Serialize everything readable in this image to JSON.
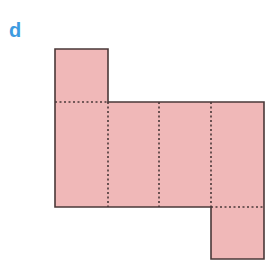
{
  "figure": {
    "label": "d",
    "colors": {
      "fill": "#f0b8b8",
      "stroke": "#4a3838",
      "label": "#3d9be0"
    }
  }
}
